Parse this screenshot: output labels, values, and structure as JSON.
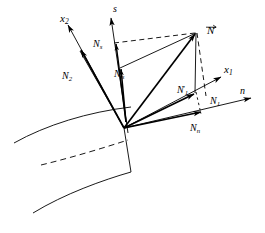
{
  "figure": {
    "type": "vector-decomposition-diagram",
    "background_color": "#ffffff",
    "stroke_color": "#000000",
    "width": 265,
    "height": 233
  },
  "labels": {
    "x2": {
      "base": "x",
      "sub": "2",
      "x": 60,
      "y": 13,
      "size": 11
    },
    "s": {
      "base": "s",
      "sub": "",
      "x": 113,
      "y": 5,
      "size": 10
    },
    "N_vector": {
      "base": "N",
      "sub": "",
      "x": 207,
      "y": 25,
      "size": 11
    },
    "Ns": {
      "base": "N",
      "sub": "s",
      "x": 93,
      "y": 40,
      "size": 10
    },
    "Nsprime": {
      "base": "N",
      "sub": "s",
      "x": 115,
      "y": 70,
      "size": 10
    },
    "N2": {
      "base": "N",
      "sub": "2",
      "x": 62,
      "y": 72,
      "size": 10
    },
    "x1": {
      "base": "x",
      "sub": "1",
      "x": 224,
      "y": 65,
      "size": 11
    },
    "N1prime": {
      "base": "N",
      "sub": "1",
      "x": 178,
      "y": 86,
      "size": 10
    },
    "N1": {
      "base": "N",
      "sub": "1",
      "x": 210,
      "y": 97,
      "size": 10
    },
    "n": {
      "base": "n",
      "sub": "",
      "x": 240,
      "y": 88,
      "size": 10
    },
    "Nn": {
      "base": "N",
      "sub": "n",
      "x": 190,
      "y": 124,
      "size": 10
    }
  },
  "geometry": {
    "origin": {
      "x": 124,
      "y": 128
    },
    "axes": [
      {
        "name": "x2-axis",
        "from": [
          124,
          128
        ],
        "to": [
          66,
          22
        ]
      },
      {
        "name": "s-axis",
        "from": [
          127,
          131
        ],
        "to": [
          110,
          14
        ]
      },
      {
        "name": "x1-axis",
        "from": [
          124,
          128
        ],
        "to": [
          222,
          76
        ]
      },
      {
        "name": "n-axis",
        "from": [
          124,
          128
        ],
        "to": [
          252,
          97
        ]
      }
    ],
    "vectors": [
      {
        "name": "N-resultant",
        "from": [
          124,
          128
        ],
        "to": [
          196,
          32
        ]
      },
      {
        "name": "N2-component",
        "from": [
          124,
          128
        ],
        "to": [
          80,
          48
        ]
      },
      {
        "name": "Ns-component",
        "from": [
          126,
          122
        ],
        "to": [
          115,
          40
        ]
      },
      {
        "name": "Nsprime-component",
        "from": [
          126,
          122
        ],
        "to": [
          120,
          66
        ]
      },
      {
        "name": "N1prime-component",
        "from": [
          124,
          128
        ],
        "to": [
          196,
          93
        ]
      },
      {
        "name": "Nn-component",
        "from": [
          124,
          128
        ],
        "to": [
          203,
          111
        ]
      },
      {
        "name": "N-to-N1prime",
        "from": [
          196,
          32
        ],
        "to": [
          196,
          93
        ]
      }
    ],
    "dashed": [
      {
        "name": "Ns-to-N-dashed",
        "from": [
          115,
          42
        ],
        "to": [
          196,
          32
        ]
      },
      {
        "name": "N-to-N1-dashed",
        "from": [
          196,
          32
        ],
        "to": [
          206,
          95
        ]
      },
      {
        "name": "N1prime-to-Nn-dotted",
        "from": [
          196,
          93
        ],
        "to": [
          203,
          113
        ]
      },
      {
        "name": "profile-dashed-midline",
        "from": [
          41,
          164
        ],
        "to": [
          128,
          140
        ]
      }
    ],
    "solid_lines": [
      {
        "name": "Nsprime-to-N-line",
        "from": [
          120,
          68
        ],
        "to": [
          196,
          32
        ]
      },
      {
        "name": "N2-to-Nsprime-line",
        "from": [
          80,
          50
        ],
        "to": [
          124,
          128
        ]
      },
      {
        "name": "trailing-edge-vertical",
        "from": [
          124,
          128
        ],
        "to": [
          131,
          172
        ]
      }
    ],
    "profile_curves": [
      {
        "name": "suction-surface",
        "points": "M 14,143 C 48,124 88,112 131,107"
      },
      {
        "name": "pressure-surface",
        "points": "M 33,213 C 66,193 104,180 131,172"
      }
    ]
  }
}
